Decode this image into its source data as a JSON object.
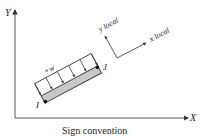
{
  "diagram": {
    "title": "Sign convention",
    "global_axes": {
      "x_label": "X",
      "y_label": "Y"
    },
    "local_axes": {
      "x_label": "x local",
      "y_label": "y local"
    },
    "member": {
      "start_node": "I",
      "end_node": "J",
      "fill_color": "#c8c8c8"
    },
    "load": {
      "label": "+w",
      "arrow_count": 6
    },
    "colors": {
      "line": "#333333",
      "member_fill": "#c8c8c8"
    }
  }
}
